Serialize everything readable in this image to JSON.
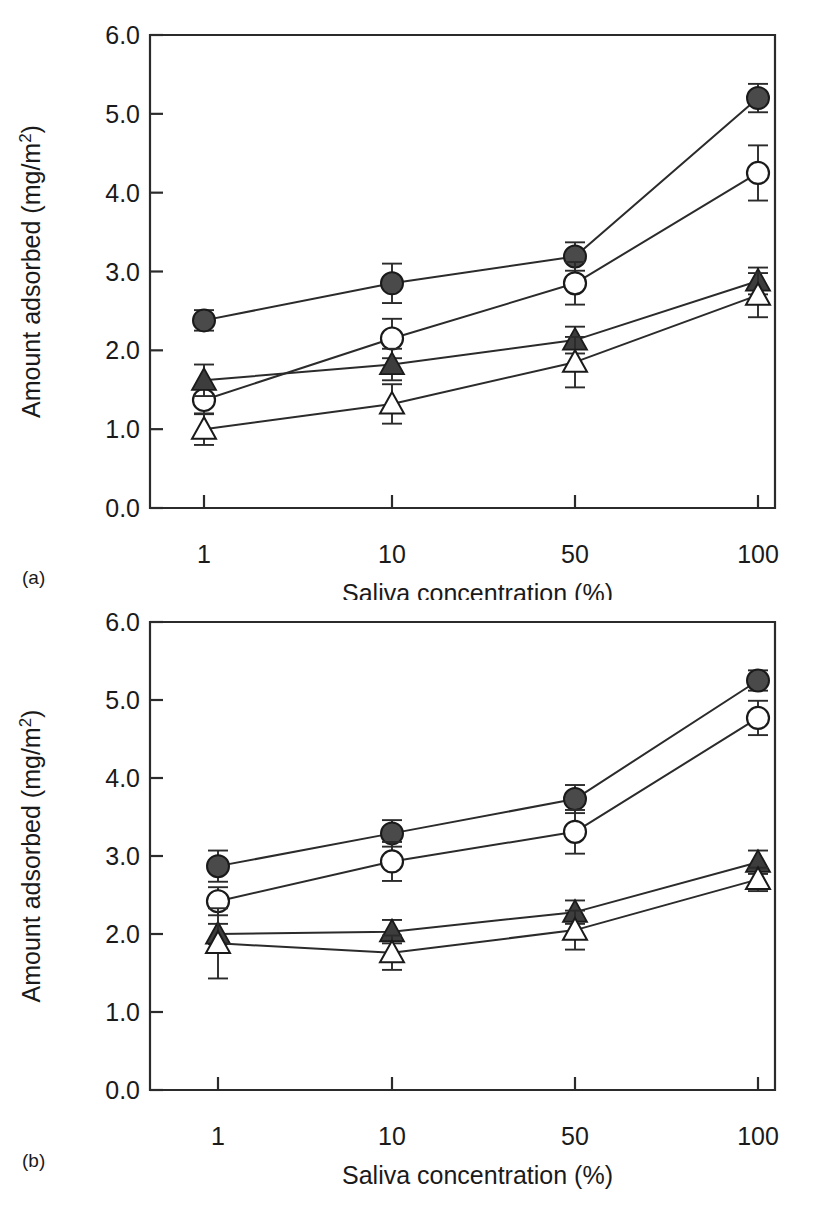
{
  "figure": {
    "panels": [
      {
        "id": "a",
        "label": "(a)",
        "chart_index": 0
      },
      {
        "id": "b",
        "label": "(b)",
        "chart_index": 1
      }
    ]
  },
  "axis": {
    "ylabel_main": "Amount adsorbed (mg/m",
    "ylabel_sup": "2",
    "ylabel_close": ")",
    "xlabel": "Saliva concentration (%)",
    "ytick_labels": [
      "6.0",
      "5.0",
      "4.0",
      "3.0",
      "2.0",
      "1.0",
      "0.0"
    ],
    "xtick_labels": [
      "1",
      "10",
      "50",
      "100"
    ]
  },
  "colors": {
    "ink": "#1a1a1a",
    "axis": "#2b2b2b",
    "filled_marker": "#4a4a4a",
    "open_marker": "#ffffff"
  },
  "chart_data": [
    {
      "type": "line",
      "panel": "(a)",
      "title": "",
      "xlabel": "Saliva concentration (%)",
      "ylabel": "Amount adsorbed (mg/m2)",
      "categories": [
        "1",
        "10",
        "50",
        "100"
      ],
      "ylim": [
        0.0,
        6.0
      ],
      "yticks": [
        0.0,
        1.0,
        2.0,
        3.0,
        4.0,
        5.0,
        6.0
      ],
      "grid": false,
      "legend": "none",
      "series": [
        {
          "name": "filled-circle",
          "marker": "filled-circle",
          "values": [
            2.38,
            2.85,
            3.19,
            5.2
          ],
          "errors": [
            0.13,
            0.25,
            0.18,
            0.18
          ]
        },
        {
          "name": "open-circle",
          "marker": "open-circle",
          "values": [
            1.37,
            2.15,
            2.85,
            4.25
          ],
          "errors": [
            0.18,
            0.25,
            0.27,
            0.35
          ]
        },
        {
          "name": "filled-triangle",
          "marker": "filled-triangle",
          "values": [
            1.62,
            1.82,
            2.13,
            2.88
          ],
          "errors": [
            0.2,
            0.2,
            0.17,
            0.17
          ]
        },
        {
          "name": "open-triangle",
          "marker": "open-triangle",
          "values": [
            1.0,
            1.32,
            1.85,
            2.7
          ],
          "errors": [
            0.2,
            0.25,
            0.32,
            0.28
          ]
        }
      ]
    },
    {
      "type": "line",
      "panel": "(b)",
      "title": "",
      "xlabel": "Saliva concentration (%)",
      "ylabel": "Amount adsorbed (mg/m2)",
      "categories": [
        "1",
        "10",
        "50",
        "100"
      ],
      "ylim": [
        0.0,
        6.0
      ],
      "yticks": [
        0.0,
        1.0,
        2.0,
        3.0,
        4.0,
        5.0,
        6.0
      ],
      "grid": false,
      "legend": "none",
      "series": [
        {
          "name": "filled-circle",
          "marker": "filled-circle",
          "values": [
            2.87,
            3.29,
            3.73,
            5.25
          ],
          "errors": [
            0.2,
            0.17,
            0.18,
            0.13
          ]
        },
        {
          "name": "open-circle",
          "marker": "open-circle",
          "values": [
            2.42,
            2.93,
            3.31,
            4.77
          ],
          "errors": [
            0.18,
            0.25,
            0.28,
            0.22
          ]
        },
        {
          "name": "filled-triangle",
          "marker": "filled-triangle",
          "values": [
            2.0,
            2.03,
            2.28,
            2.92
          ],
          "errors": [
            0.13,
            0.15,
            0.15,
            0.15
          ]
        },
        {
          "name": "open-triangle",
          "marker": "open-triangle",
          "values": [
            1.88,
            1.76,
            2.05,
            2.7
          ],
          "errors": [
            0.45,
            0.22,
            0.25,
            0.15
          ]
        }
      ]
    }
  ]
}
